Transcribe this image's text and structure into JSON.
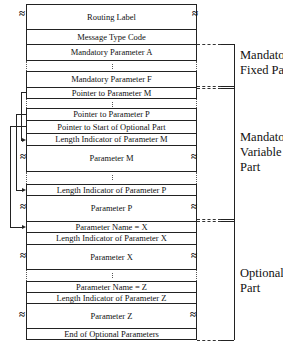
{
  "diagram": {
    "fields": [
      {
        "id": "routing-label",
        "label": "Routing Label",
        "top": 4,
        "height": 26,
        "wave": true
      },
      {
        "id": "message-type-code",
        "label": "Message Type Code",
        "top": 29,
        "height": 16,
        "wave": false
      },
      {
        "id": "mandatory-parameter-a",
        "label": "Mandatory Parameter A",
        "top": 44,
        "height": 17,
        "wave": false
      },
      {
        "id": "mandatory-parameter-f",
        "label": "Mandatory Parameter F",
        "top": 71,
        "height": 17,
        "wave": false
      },
      {
        "id": "pointer-to-parameter-m",
        "label": "Pointer to Parameter M",
        "top": 87,
        "height": 12,
        "wave": false
      },
      {
        "id": "pointer-to-parameter-p",
        "label": "Pointer to Parameter P",
        "top": 108,
        "height": 13,
        "wave": false
      },
      {
        "id": "pointer-to-start-of-optional-part",
        "label": "Pointer to Start of Optional Part",
        "top": 120,
        "height": 14,
        "wave": false
      },
      {
        "id": "length-indicator-of-parameter-m",
        "label": "Length Indicator of Parameter M",
        "top": 133,
        "height": 13,
        "wave": false
      },
      {
        "id": "parameter-m",
        "label": "Parameter M",
        "top": 145,
        "height": 27,
        "wave": true
      },
      {
        "id": "length-indicator-of-parameter-p",
        "label": "Length Indicator of Parameter P",
        "top": 184,
        "height": 12,
        "wave": false
      },
      {
        "id": "parameter-p",
        "label": "Parameter P",
        "top": 195,
        "height": 27,
        "wave": true
      },
      {
        "id": "parameter-name-x",
        "label": "Parameter Name = X",
        "top": 221,
        "height": 12,
        "wave": false
      },
      {
        "id": "length-indicator-of-parameter-x",
        "label": "Length Indicator of Parameter X",
        "top": 232,
        "height": 13,
        "wave": false
      },
      {
        "id": "parameter-x",
        "label": "Parameter X",
        "top": 244,
        "height": 26,
        "wave": true
      },
      {
        "id": "parameter-name-z",
        "label": "Parameter Name = Z",
        "top": 281,
        "height": 12,
        "wave": false
      },
      {
        "id": "length-indicator-of-parameter-z",
        "label": "Length Indicator of Parameter Z",
        "top": 292,
        "height": 12,
        "wave": false
      },
      {
        "id": "parameter-z",
        "label": "Parameter Z",
        "top": 303,
        "height": 26,
        "wave": true
      },
      {
        "id": "end-of-optional-parameters",
        "label": "End of Optional Parameters",
        "top": 328,
        "height": 12,
        "wave": false
      }
    ],
    "gaps": [
      {
        "top": 61,
        "height": 10
      },
      {
        "top": 99,
        "height": 9
      },
      {
        "top": 172,
        "height": 12
      },
      {
        "top": 270,
        "height": 11
      }
    ],
    "sections": {
      "mandatory_fixed": {
        "line1": "Mandatory",
        "line2": "Fixed Part"
      },
      "mandatory_variable": {
        "line1": "Mandatory",
        "line2": "Variable",
        "line3": "Part"
      },
      "optional": {
        "line1": "Optional",
        "line2": "Part"
      }
    },
    "wave_glyph": "≈",
    "gap_mark": ":"
  }
}
